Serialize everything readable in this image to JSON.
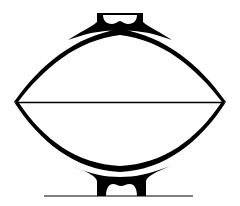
{
  "figure": {
    "type": "vessel-profile-drawing",
    "colors": {
      "ink": "#000000",
      "background": "#ffffff"
    },
    "parts": [
      "top-foot",
      "upper-wall",
      "rim-diameter-line",
      "lower-wall",
      "bottom-foot",
      "ground-line"
    ]
  }
}
